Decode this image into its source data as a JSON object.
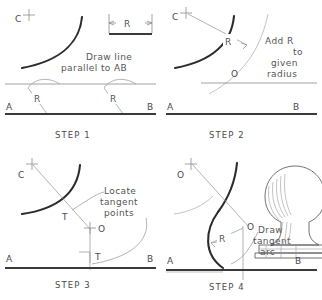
{
  "figure": {
    "panel_count": 4,
    "colors": {
      "object_line": "#2b2b2b",
      "construction_line": "#8c8c8c",
      "text": "#555555",
      "background": "#ffffff"
    }
  },
  "panels": [
    {
      "id": "step1",
      "step_label": "STEP  1",
      "instruction_line1": "Draw line",
      "instruction_line2": "parallel to AB",
      "points": {
        "center_c": "C",
        "line_start": "A",
        "line_end": "B"
      },
      "radius_label_left": "R",
      "radius_label_right": "R",
      "dimension_box": {
        "label": "R",
        "style": "double-arrow"
      }
    },
    {
      "id": "step2",
      "step_label": "STEP  2",
      "instruction_line1": "Add  R",
      "instruction_line2": "to",
      "instruction_line3": "given",
      "instruction_line4": "radius",
      "points": {
        "center_c": "C",
        "center_o": "O",
        "line_start": "A",
        "line_end": "B"
      },
      "radius_label": "R"
    },
    {
      "id": "step3",
      "step_label": "STEP  3",
      "instruction_line1": "Locate",
      "instruction_line2": "tangent",
      "instruction_line3": "points",
      "points": {
        "center_c": "C",
        "center_o": "O",
        "tangent_upper": "T",
        "tangent_lower": "T",
        "line_start": "A",
        "line_end": "B"
      },
      "right_angle_marker": true
    },
    {
      "id": "step4",
      "step_label": "STEP  4",
      "instruction_line1": "Draw",
      "instruction_line2": "tangent",
      "instruction_line3": "arc",
      "points": {
        "center_upper": "O",
        "center_o": "O",
        "line_start": "A",
        "line_end": "B"
      },
      "radius_label": "R",
      "pictorial": {
        "name": "turned-knob-finial-on-base",
        "shading": "line-shaded"
      }
    }
  ]
}
